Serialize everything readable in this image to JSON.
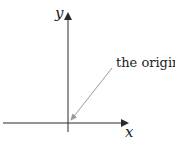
{
  "diagram": {
    "x_axis_label": "x",
    "y_axis_label": "y",
    "annotation": "the origin",
    "colors": {
      "axis": "#2a2a2a",
      "pointer": "#9a9a9a",
      "text": "#222222"
    }
  }
}
